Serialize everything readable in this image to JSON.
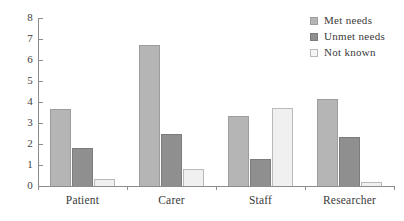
{
  "chart_data": {
    "type": "bar",
    "title": "",
    "xlabel": "",
    "ylabel": "",
    "ylim": [
      0,
      8
    ],
    "yticks": [
      "0",
      "1",
      "2",
      "3",
      "4",
      "5",
      "6",
      "7",
      "8"
    ],
    "grid": false,
    "legend_position": "top-right",
    "categories": [
      "Patient",
      "Carer",
      "Staff",
      "Researcher"
    ],
    "series": [
      {
        "name": "Met needs",
        "color": "#b5b5b5",
        "values": [
          3.65,
          6.7,
          3.35,
          4.15
        ]
      },
      {
        "name": "Unmet needs",
        "color": "#8f8f8f",
        "values": [
          1.8,
          2.5,
          1.3,
          2.35
        ]
      },
      {
        "name": "Not known",
        "color": "#f0f0f0",
        "values": [
          0.35,
          0.8,
          3.7,
          0.2
        ]
      }
    ]
  },
  "legend": {
    "items": [
      {
        "label": "Met needs",
        "swatch": "met-needs-swatch"
      },
      {
        "label": "Unmet needs",
        "swatch": "unmet-needs-swatch"
      },
      {
        "label": "Not known",
        "swatch": "not-known-swatch"
      }
    ]
  },
  "axes": {
    "y_labels": [
      "8",
      "7",
      "6",
      "5",
      "4",
      "3",
      "2",
      "1",
      "0"
    ],
    "x_labels": [
      "Patient",
      "Carer",
      "Staff",
      "Researcher"
    ]
  }
}
